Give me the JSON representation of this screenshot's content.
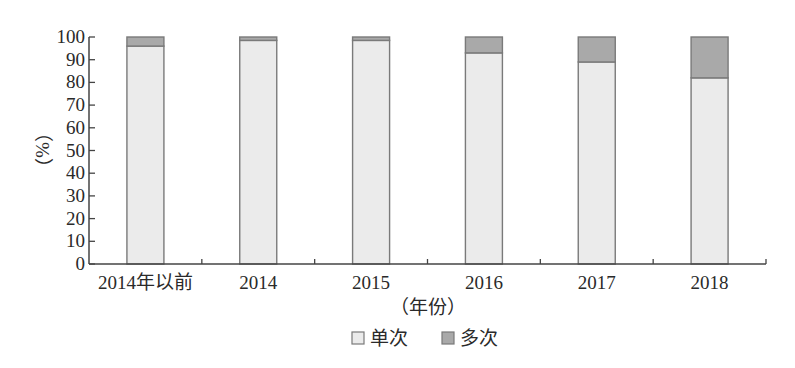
{
  "chart_data": {
    "type": "bar",
    "stacked": true,
    "title": "",
    "xlabel": "（年份）",
    "ylabel": "（%）",
    "ylim": [
      0,
      100
    ],
    "yticks": [
      0,
      10,
      20,
      30,
      40,
      50,
      60,
      70,
      80,
      90,
      100
    ],
    "grid": false,
    "legend_position": "bottom",
    "categories": [
      "2014年以前",
      "2014",
      "2015",
      "2016",
      "2017",
      "2018"
    ],
    "series": [
      {
        "name": "单次",
        "color": "#ebebeb",
        "values": [
          96,
          98.5,
          98.5,
          93,
          89,
          82
        ]
      },
      {
        "name": "多次",
        "color": "#a9a9a9",
        "values": [
          4,
          1.5,
          1.5,
          7,
          11,
          18
        ]
      }
    ]
  },
  "colors": {
    "axis": "#444444",
    "bar_border": "#7a7a7a",
    "text": "#2a2a2a"
  }
}
